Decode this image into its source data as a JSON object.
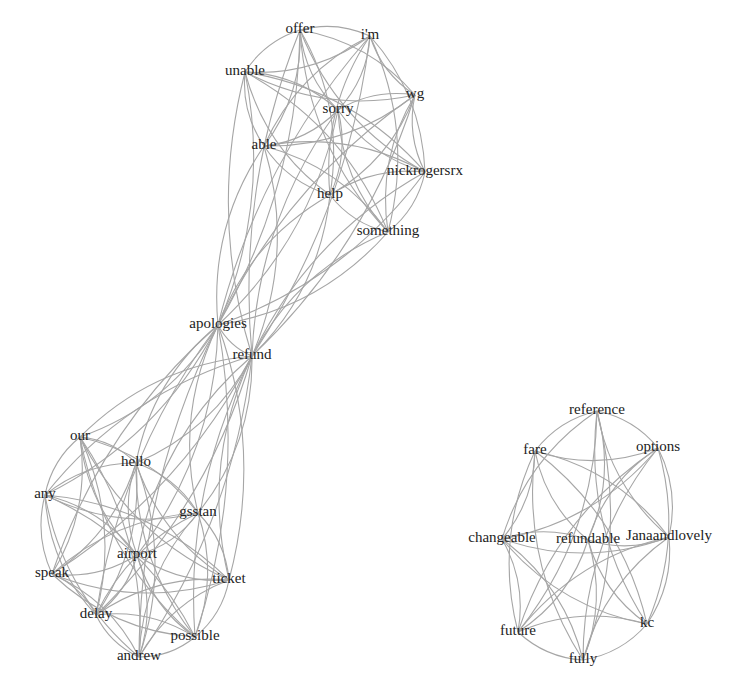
{
  "diagram": {
    "type": "word co-occurrence network",
    "edge_color": "#a6a6a6",
    "label_color": "#222222",
    "clusters": [
      {
        "id": "cluster-apology",
        "nodes": [
          {
            "id": "offer",
            "label": "offer",
            "x": 300,
            "y": 30
          },
          {
            "id": "im",
            "label": "i'm",
            "x": 370,
            "y": 36
          },
          {
            "id": "unable",
            "label": "unable",
            "x": 245,
            "y": 72
          },
          {
            "id": "wg",
            "label": "wg",
            "x": 415,
            "y": 95
          },
          {
            "id": "sorry",
            "label": "sorry",
            "x": 338,
            "y": 110
          },
          {
            "id": "able",
            "label": "able",
            "x": 264,
            "y": 146
          },
          {
            "id": "nickrogersrx",
            "label": "nickrogersrx",
            "x": 425,
            "y": 172
          },
          {
            "id": "help",
            "label": "help",
            "x": 330,
            "y": 195
          },
          {
            "id": "something",
            "label": "something",
            "x": 388,
            "y": 232
          },
          {
            "id": "apologies",
            "label": "apologies",
            "x": 218,
            "y": 325
          },
          {
            "id": "refund",
            "label": "refund",
            "x": 252,
            "y": 356
          },
          {
            "id": "our",
            "label": "our",
            "x": 80,
            "y": 437
          },
          {
            "id": "hello",
            "label": "hello",
            "x": 136,
            "y": 463
          },
          {
            "id": "any",
            "label": "any",
            "x": 45,
            "y": 495
          },
          {
            "id": "gsstan",
            "label": "gsstan",
            "x": 198,
            "y": 513
          },
          {
            "id": "airport",
            "label": "airport",
            "x": 137,
            "y": 555
          },
          {
            "id": "speak",
            "label": "speak",
            "x": 52,
            "y": 574
          },
          {
            "id": "ticket",
            "label": "ticket",
            "x": 229,
            "y": 580
          },
          {
            "id": "delay",
            "label": "delay",
            "x": 96,
            "y": 615
          },
          {
            "id": "possible",
            "label": "possible",
            "x": 195,
            "y": 637
          },
          {
            "id": "andrew",
            "label": "andrew",
            "x": 139,
            "y": 657
          }
        ]
      },
      {
        "id": "cluster-fare",
        "nodes": [
          {
            "id": "reference",
            "label": "reference",
            "x": 597,
            "y": 411
          },
          {
            "id": "fare",
            "label": "fare",
            "x": 535,
            "y": 451
          },
          {
            "id": "options",
            "label": "options",
            "x": 658,
            "y": 448
          },
          {
            "id": "changeable",
            "label": "changeable",
            "x": 502,
            "y": 539
          },
          {
            "id": "refundable",
            "label": "refundable",
            "x": 588,
            "y": 540
          },
          {
            "id": "janaandlovely",
            "label": "Janaandlovely",
            "x": 669,
            "y": 537
          },
          {
            "id": "future",
            "label": "future",
            "x": 518,
            "y": 632
          },
          {
            "id": "kc",
            "label": "kc",
            "x": 647,
            "y": 624
          },
          {
            "id": "fully",
            "label": "fully",
            "x": 583,
            "y": 660
          }
        ]
      }
    ],
    "edge_groups": [
      {
        "members": [
          "offer",
          "im",
          "unable",
          "wg",
          "sorry",
          "able",
          "nickrogersrx",
          "help",
          "something"
        ],
        "complete": true
      },
      {
        "members": [
          "our",
          "hello",
          "any",
          "gsstan",
          "airport",
          "speak",
          "ticket",
          "delay",
          "possible",
          "andrew"
        ],
        "complete": true
      },
      {
        "members": [
          "reference",
          "fare",
          "options",
          "changeable",
          "refundable",
          "janaandlovely",
          "future",
          "kc",
          "fully"
        ],
        "complete": true
      },
      {
        "hub": [
          "apologies",
          "refund"
        ],
        "targets": [
          "offer",
          "im",
          "unable",
          "wg",
          "sorry",
          "able",
          "nickrogersrx",
          "help",
          "something",
          "our",
          "hello",
          "any",
          "gsstan",
          "airport",
          "speak",
          "ticket",
          "delay",
          "possible",
          "andrew"
        ]
      },
      {
        "members": [
          "apologies",
          "refund"
        ],
        "complete": true
      }
    ]
  }
}
